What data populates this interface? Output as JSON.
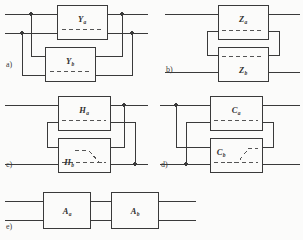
{
  "figure": {
    "background_color": "#fbfbfa",
    "line_color": "#3a3a3a",
    "dash_color": "#555555",
    "panels": [
      {
        "id": "a",
        "caption": "a)",
        "connection": "parallel-parallel",
        "blocks": [
          {
            "id": "a-top",
            "letter": "Y",
            "subscript": "a"
          },
          {
            "id": "a-bottom",
            "letter": "Y",
            "subscript": "b"
          }
        ]
      },
      {
        "id": "b",
        "caption": "b)",
        "connection": "series-series",
        "blocks": [
          {
            "id": "b-top",
            "letter": "Z",
            "subscript": "a"
          },
          {
            "id": "b-bottom",
            "letter": "Z",
            "subscript": "b"
          }
        ]
      },
      {
        "id": "c",
        "caption": "c)",
        "connection": "series-parallel",
        "blocks": [
          {
            "id": "c-top",
            "letter": "H",
            "subscript": "a"
          },
          {
            "id": "c-bottom",
            "letter": "H",
            "subscript": "b"
          }
        ]
      },
      {
        "id": "d",
        "caption": "d)",
        "connection": "parallel-series",
        "blocks": [
          {
            "id": "d-top",
            "letter": "C",
            "subscript": "a"
          },
          {
            "id": "d-bottom",
            "letter": "C",
            "subscript": "b"
          }
        ]
      },
      {
        "id": "e",
        "caption": "e)",
        "connection": "cascade",
        "blocks": [
          {
            "id": "e-left",
            "letter": "A",
            "subscript": "a"
          },
          {
            "id": "e-right",
            "letter": "A",
            "subscript": "b"
          }
        ]
      }
    ]
  }
}
